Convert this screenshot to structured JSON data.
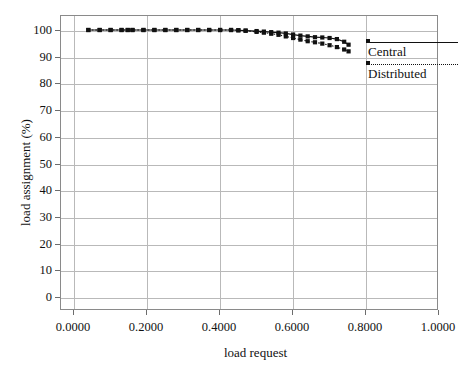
{
  "chart_data": {
    "type": "line",
    "title": "",
    "xlabel": "load request",
    "ylabel": "load assignment (%)",
    "xlim": [
      0.0,
      1.0
    ],
    "ylim": [
      0,
      100
    ],
    "grid": true,
    "legend_position": "right-outside",
    "xticks": [
      0.0,
      0.2,
      0.4,
      0.6,
      0.8,
      1.0
    ],
    "xtick_labels": [
      "0.0000",
      "0.2000",
      "0.4000",
      "0.6000",
      "0.8000",
      "1.0000"
    ],
    "yticks": [
      0,
      10,
      20,
      30,
      40,
      50,
      60,
      70,
      80,
      90,
      100
    ],
    "ytick_labels": [
      "0",
      "10",
      "20",
      "30",
      "40",
      "50",
      "60",
      "70",
      "80",
      "90",
      "100"
    ],
    "series": [
      {
        "name": "Central",
        "linestyle": "solid",
        "marker": "square",
        "color": "#111111",
        "x": [
          0.042,
          0.073,
          0.103,
          0.133,
          0.15,
          0.163,
          0.193,
          0.223,
          0.253,
          0.283,
          0.313,
          0.343,
          0.373,
          0.403,
          0.433,
          0.453,
          0.473,
          0.503,
          0.523,
          0.543,
          0.563,
          0.583,
          0.603,
          0.623,
          0.643,
          0.663,
          0.683,
          0.703,
          0.723,
          0.743,
          0.755
        ],
        "y": [
          100.0,
          100.0,
          100.0,
          100.0,
          100.0,
          100.0,
          100.0,
          100.0,
          100.0,
          100.0,
          100.0,
          100.0,
          100.0,
          100.0,
          100.0,
          99.9,
          99.8,
          99.6,
          99.4,
          99.2,
          99.0,
          98.7,
          98.3,
          97.9,
          97.6,
          97.3,
          97.2,
          97.0,
          96.6,
          95.6,
          94.5
        ]
      },
      {
        "name": "Distributed",
        "linestyle": "dotted",
        "marker": "square",
        "color": "#111111",
        "x": [
          0.042,
          0.073,
          0.103,
          0.133,
          0.15,
          0.163,
          0.193,
          0.223,
          0.253,
          0.283,
          0.313,
          0.343,
          0.373,
          0.403,
          0.433,
          0.453,
          0.473,
          0.503,
          0.523,
          0.543,
          0.563,
          0.583,
          0.603,
          0.623,
          0.643,
          0.663,
          0.683,
          0.703,
          0.723,
          0.743,
          0.755
        ],
        "y": [
          100.0,
          100.0,
          100.0,
          100.0,
          100.0,
          100.0,
          100.0,
          100.0,
          100.0,
          100.0,
          100.0,
          100.0,
          100.0,
          100.0,
          100.0,
          99.9,
          99.7,
          99.3,
          99.0,
          98.6,
          98.2,
          97.6,
          97.0,
          96.4,
          95.8,
          95.4,
          94.9,
          94.3,
          93.6,
          92.7,
          92.0
        ]
      }
    ]
  },
  "legend": {
    "items": [
      {
        "label": "Central"
      },
      {
        "label": "Distributed"
      }
    ]
  }
}
